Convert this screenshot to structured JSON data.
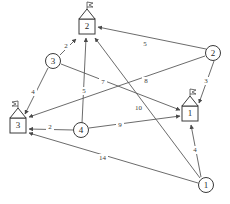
{
  "diagram": {
    "type": "directed-weighted-graph",
    "title": "",
    "background_color": "#ffffff",
    "line_color": "#5a5a5a",
    "text_color": "#2a2a2a",
    "house_nodes": [
      {
        "id": "house-2",
        "label": "2",
        "x": 87,
        "y": 26,
        "icon": "house-with-flag-icon"
      },
      {
        "id": "house-3",
        "label": "3",
        "x": 18,
        "y": 125,
        "icon": "house-with-flag-icon"
      },
      {
        "id": "house-1",
        "label": "1",
        "x": 190,
        "y": 113,
        "icon": "house-with-flag-icon"
      }
    ],
    "circle_nodes": [
      {
        "id": "circle-3",
        "label": "3",
        "x": 53,
        "y": 61
      },
      {
        "id": "circle-2",
        "label": "2",
        "x": 213,
        "y": 53
      },
      {
        "id": "circle-4",
        "label": "4",
        "x": 81,
        "y": 130
      },
      {
        "id": "circle-1",
        "label": "1",
        "x": 206,
        "y": 185
      }
    ],
    "edges": [
      {
        "id": "e-c3-h2",
        "from": "circle-3",
        "to": "house-2",
        "weight": "2",
        "label_x": 66,
        "label_y": 46
      },
      {
        "id": "e-c3-h3",
        "from": "circle-3",
        "to": "house-3",
        "weight": "4",
        "label_x": 33,
        "label_y": 92
      },
      {
        "id": "e-c2-h2",
        "from": "circle-2",
        "to": "house-2",
        "weight": "5",
        "label_x": 145,
        "label_y": 44
      },
      {
        "id": "e-c2-h1",
        "from": "circle-2",
        "to": "house-1",
        "weight": "3",
        "label_x": 206,
        "label_y": 81
      },
      {
        "id": "e-c4-h2",
        "from": "circle-4",
        "to": "house-2",
        "weight": "5",
        "label_x": 84,
        "label_y": 91
      },
      {
        "id": "e-c4-h3",
        "from": "circle-4",
        "to": "house-3",
        "weight": "2",
        "label_x": 50,
        "label_y": 127
      },
      {
        "id": "e-c4-h1",
        "from": "circle-4",
        "to": "house-1",
        "weight": "9",
        "label_x": 120,
        "label_y": 125
      },
      {
        "id": "e-c3-h1",
        "from": "circle-3",
        "to": "house-1",
        "weight": "7",
        "label_x": 103,
        "label_y": 82
      },
      {
        "id": "e-c2-h3",
        "from": "circle-2",
        "to": "house-3",
        "weight": "8",
        "label_x": 146,
        "label_y": 81
      },
      {
        "id": "e-c1-h2",
        "from": "circle-1",
        "to": "house-2",
        "weight": "10",
        "label_x": 138,
        "label_y": 108
      },
      {
        "id": "e-c1-h3",
        "from": "circle-1",
        "to": "house-3",
        "weight": "14",
        "label_x": 102,
        "label_y": 158
      },
      {
        "id": "e-c1-h1",
        "from": "circle-1",
        "to": "house-1",
        "weight": "4",
        "label_x": 195,
        "label_y": 150
      }
    ]
  }
}
